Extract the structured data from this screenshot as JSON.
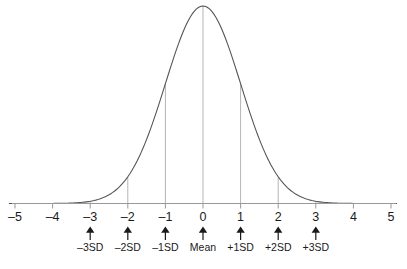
{
  "figure": {
    "background_color": "#ffffff",
    "curve_color": "#555555",
    "axis_color": "#999999",
    "gridline_color": "#b5b5b5",
    "text_color": "#1a1a1a"
  },
  "chart_data": {
    "type": "line",
    "title": "",
    "xlabel": "",
    "ylabel": "",
    "xlim": [
      -5.1,
      5.1
    ],
    "ylim": [
      0,
      1
    ],
    "grid": false,
    "legend": "none",
    "distribution": "standard normal (Gaussian), mean 0, sd 1",
    "axis_tick_values": [
      -5,
      -4,
      -3,
      -2,
      -1,
      0,
      1,
      2,
      3,
      4,
      5
    ],
    "axis_tick_labels": [
      "–5",
      "–4",
      "–3",
      "–2",
      "–1",
      "0",
      "1",
      "2",
      "3",
      "4",
      "5"
    ],
    "sd_markers": [
      {
        "x": -3,
        "label": "–3SD",
        "arrow": "↑",
        "height_fraction": 0.011
      },
      {
        "x": -2,
        "label": "–2SD",
        "arrow": "↑",
        "height_fraction": 0.135
      },
      {
        "x": -1,
        "label": "–1SD",
        "arrow": "↑",
        "height_fraction": 0.607
      },
      {
        "x": 0,
        "label": "Mean",
        "arrow": "↑",
        "height_fraction": 1.0
      },
      {
        "x": 1,
        "label": "+1SD",
        "arrow": "↑",
        "height_fraction": 0.607
      },
      {
        "x": 2,
        "label": "+2SD",
        "arrow": "↑",
        "height_fraction": 0.135
      },
      {
        "x": 3,
        "label": "+3SD",
        "arrow": "↑",
        "height_fraction": 0.011
      }
    ],
    "x": [
      -5.1,
      -4.8,
      -4.5,
      -4.2,
      -3.9,
      -3.6,
      -3.3,
      -3.0,
      -2.7,
      -2.4,
      -2.1,
      -1.8,
      -1.5,
      -1.2,
      -0.9,
      -0.6,
      -0.3,
      0,
      0.3,
      0.6,
      0.9,
      1.2,
      1.5,
      1.8,
      2.1,
      2.4,
      2.7,
      3.0,
      3.3,
      3.6,
      3.9,
      4.2,
      4.5,
      4.8,
      5.1
    ],
    "y": [
      0.0,
      0.0,
      0.0,
      0.0,
      0.001,
      0.002,
      0.004,
      0.011,
      0.027,
      0.056,
      0.11,
      0.198,
      0.325,
      0.487,
      0.667,
      0.835,
      0.956,
      1.0,
      0.956,
      0.835,
      0.667,
      0.487,
      0.325,
      0.198,
      0.11,
      0.056,
      0.027,
      0.011,
      0.004,
      0.002,
      0.001,
      0.0,
      0.0,
      0.0,
      0.0
    ]
  }
}
